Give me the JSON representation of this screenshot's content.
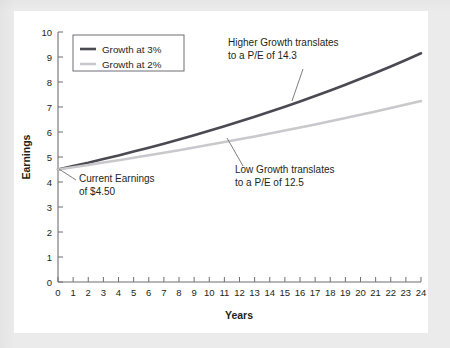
{
  "figure": {
    "background_color": "#ebebeb",
    "card_color": "#ffffff",
    "axis_color": "#6f6f75",
    "text_color": "#231f20"
  },
  "chart_data": {
    "type": "line",
    "title": "",
    "xlabel": "Years",
    "ylabel": "Earnings",
    "xlim": [
      0,
      24
    ],
    "ylim": [
      0,
      10
    ],
    "grid": false,
    "legend_position": "top-left",
    "x": [
      0,
      1,
      2,
      3,
      4,
      5,
      6,
      7,
      8,
      9,
      10,
      11,
      12,
      13,
      14,
      15,
      16,
      17,
      18,
      19,
      20,
      21,
      22,
      23,
      24
    ],
    "xticklabels": [
      "0",
      "1",
      "2",
      "3",
      "4",
      "5",
      "6",
      "7",
      "8",
      "9",
      "10",
      "11",
      "12",
      "13",
      "14",
      "15",
      "16",
      "17",
      "18",
      "19",
      "20",
      "21",
      "22",
      "23",
      "24"
    ],
    "yticklabels": [
      "0",
      "1",
      "2",
      "3",
      "4",
      "5",
      "6",
      "7",
      "8",
      "9",
      "10"
    ],
    "series": [
      {
        "name": "Growth at 3%",
        "color": "#4a4a52",
        "linewidth": 2.6,
        "values": [
          4.5,
          4.64,
          4.77,
          4.92,
          5.06,
          5.22,
          5.37,
          5.53,
          5.7,
          5.87,
          6.05,
          6.23,
          6.42,
          6.61,
          6.81,
          7.01,
          7.22,
          7.44,
          7.66,
          7.89,
          8.13,
          8.37,
          8.62,
          8.88,
          9.15
        ]
      },
      {
        "name": "Growth at 2%",
        "color": "#c9c9cd",
        "linewidth": 2.6,
        "values": [
          4.5,
          4.59,
          4.68,
          4.78,
          4.87,
          4.97,
          5.07,
          5.17,
          5.27,
          5.38,
          5.49,
          5.6,
          5.71,
          5.82,
          5.94,
          6.06,
          6.18,
          6.3,
          6.43,
          6.56,
          6.69,
          6.82,
          6.96,
          7.1,
          7.24
        ]
      }
    ],
    "annotations": [
      {
        "id": "current-earnings",
        "lines": [
          "Current Earnings",
          "of $4.50"
        ],
        "text_x": 79,
        "text_y": 182,
        "leader": {
          "x1": 76,
          "y1": 180,
          "x2": 59,
          "y2": 169
        }
      },
      {
        "id": "higher-growth",
        "lines": [
          "Higher Growth translates",
          "to a P/E of 14.3"
        ],
        "text_x": 228,
        "text_y": 46,
        "leader": {
          "x1": 303,
          "y1": 69,
          "x2": 292,
          "y2": 101
        }
      },
      {
        "id": "low-growth",
        "lines": [
          "Low Growth translates",
          "to a P/E of 12.5"
        ],
        "text_x": 235,
        "text_y": 173,
        "leader": {
          "x1": 227,
          "y1": 138,
          "x2": 243,
          "y2": 166
        }
      }
    ]
  },
  "legend": {
    "items": [
      {
        "label": "Growth at 3%",
        "color": "#4a4a52"
      },
      {
        "label": "Growth at 2%",
        "color": "#c9c9cd"
      }
    ]
  }
}
